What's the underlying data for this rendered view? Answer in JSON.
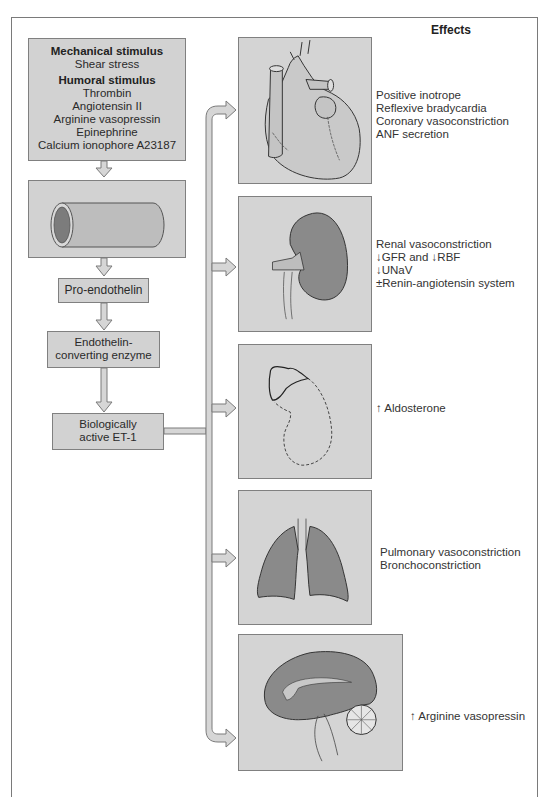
{
  "header": {
    "effects_title": "Effects"
  },
  "pathway": {
    "stimulus_box": {
      "mechanical_title": "Mechanical stimulus",
      "mechanical_items": [
        "Shear stress"
      ],
      "humoral_title": "Humoral stimulus",
      "humoral_items": [
        "Thrombin",
        "Angiotensin II",
        "Arginine vasopressin",
        "Epinephrine",
        "Calcium ionophore A23187"
      ]
    },
    "vessel_box": {
      "icon": "blood-vessel-icon"
    },
    "pro_endothelin": {
      "label": "Pro-endothelin"
    },
    "ece": {
      "line1": "Endothelin-",
      "line2": "converting enzyme"
    },
    "et1": {
      "line1": "Biologically",
      "line2": "active ET-1"
    }
  },
  "targets": [
    {
      "organ": "heart",
      "icon": "heart-icon",
      "effects": [
        "Positive inotrope",
        "Reflexive bradycardia",
        "Coronary vasoconstriction",
        "ANF secretion"
      ]
    },
    {
      "organ": "kidney",
      "icon": "kidney-icon",
      "effects": [
        "Renal vasoconstriction",
        "↓GFR and ↓RBF",
        "↓UNaV",
        "±Renin-angiotensin system"
      ]
    },
    {
      "organ": "adrenal",
      "icon": "adrenal-gland-icon",
      "effects": [
        "↑ Aldosterone"
      ]
    },
    {
      "organ": "lungs",
      "icon": "lungs-icon",
      "effects": [
        "Pulmonary vasoconstriction",
        "Bronchoconstriction"
      ]
    },
    {
      "organ": "brain",
      "icon": "brain-icon",
      "effects": [
        "↑ Arginine vasopressin"
      ]
    }
  ],
  "colors": {
    "box_fill": "#d2d2d2",
    "organ_fill": "#8a8a8a",
    "border": "#808080",
    "arrow_fill": "#d6d6d6"
  }
}
